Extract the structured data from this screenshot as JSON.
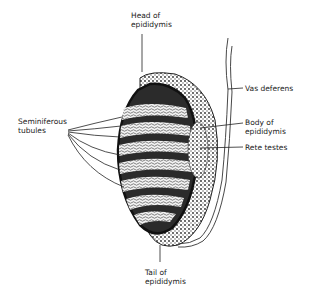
{
  "diagram": {
    "labels": {
      "head": "Head of\nepididymis",
      "vas": "Vas deferens",
      "body": "Body of\nepididymis",
      "rete": "Rete testes",
      "seminiferous": "Seminiferous\ntubules",
      "tail": "Tail of\nepididymis"
    },
    "colors": {
      "ink": "#1a1a1a",
      "fill": "#d9d9d9",
      "background": "#ffffff"
    }
  }
}
